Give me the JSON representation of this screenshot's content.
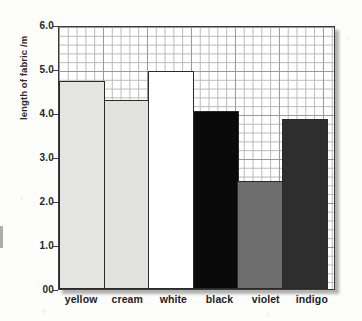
{
  "chart_data": {
    "type": "bar",
    "title": "",
    "xlabel": "",
    "ylabel": "length of fabric /m",
    "categories": [
      "yellow",
      "cream",
      "white",
      "black",
      "violet",
      "indigo"
    ],
    "values": [
      4.72,
      4.3,
      4.95,
      4.05,
      2.45,
      3.86
    ],
    "series": [
      {
        "name": "length of fabric /m",
        "values": [
          4.72,
          4.3,
          4.95,
          4.05,
          2.45,
          3.86
        ]
      }
    ],
    "bar_fill_colors": [
      "#e4e4e2",
      "#e1e1df",
      "#ffffff",
      "#0a0a0a",
      "#6e6e6e",
      "#2e2e2e"
    ],
    "bar_outline_color": "#2a2a2a",
    "ylim": [
      0,
      6
    ],
    "ytick_labels": [
      "6.0",
      "5.0",
      "4.0",
      "3.0",
      "2.0",
      "1.0",
      "00"
    ],
    "ytick_values": [
      6,
      5,
      4,
      3,
      2,
      1,
      0
    ],
    "grid": true,
    "grid_minor": true,
    "legend": "none"
  },
  "axes": {
    "y_title": "length of fabric /m"
  }
}
